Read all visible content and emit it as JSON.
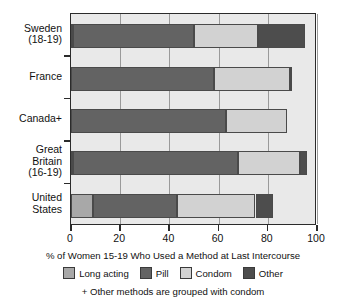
{
  "chart_data": {
    "type": "bar",
    "orientation": "horizontal",
    "stacked": true,
    "title": "",
    "xlabel": "% of Women 15-19 Who Used a Method at Last Intercourse",
    "ylabel": "",
    "xlim": [
      0,
      100
    ],
    "xticks": [
      0,
      20,
      40,
      60,
      80,
      100
    ],
    "xtick_labels": [
      "0",
      "20",
      "40",
      "60",
      "80",
      "100"
    ],
    "grid": true,
    "legend_position": "bottom",
    "footnote": "+ Other methods are grouped with condom",
    "categories": [
      "Sweden (18-19)",
      "France",
      "Canada+",
      "Great Britain (16-19)",
      "United States"
    ],
    "category_lines": [
      [
        "Sweden",
        "(18-19)"
      ],
      [
        "France"
      ],
      [
        "Canada+"
      ],
      [
        "Great",
        "Britain",
        "(16-19)"
      ],
      [
        "United",
        "States"
      ]
    ],
    "series": [
      {
        "name": "Long acting",
        "color": "#a8a8a8",
        "values": [
          1,
          0,
          0,
          1,
          9
        ]
      },
      {
        "name": "Pill",
        "color": "#636363",
        "values": [
          49,
          58,
          63,
          67,
          34
        ]
      },
      {
        "name": "Condom",
        "color": "#d2d2d2",
        "values": [
          26,
          31,
          25,
          25,
          32
        ]
      },
      {
        "name": "Other",
        "color": "#4d4d4d",
        "values": [
          19,
          1,
          0,
          3,
          7
        ]
      }
    ],
    "totals": [
      95,
      90,
      88,
      96,
      82
    ],
    "legend": [
      {
        "label": "Long acting",
        "color": "#a8a8a8"
      },
      {
        "label": "Pill",
        "color": "#636363"
      },
      {
        "label": "Condom",
        "color": "#d2d2d2"
      },
      {
        "label": "Other",
        "color": "#4d4d4d"
      }
    ],
    "colors": {
      "long_acting": "#a8a8a8",
      "pill": "#636363",
      "condom": "#d2d2d2",
      "other": "#4d4d4d",
      "plot_background": "#e9e9e9",
      "axis": "#2b2b2b"
    }
  }
}
